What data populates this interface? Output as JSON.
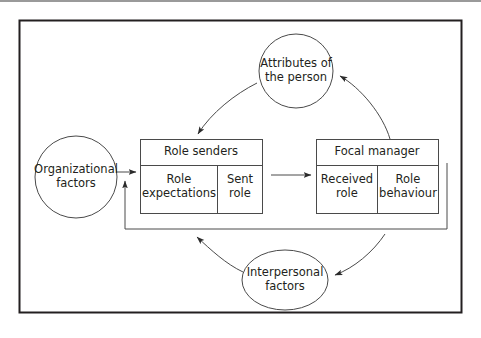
{
  "figure": {
    "type": "cycle-diagram",
    "title_text": "",
    "border_color": "#231f20",
    "line_color": "#3a3a3a",
    "text_color": "#231f20",
    "background": "#ffffff",
    "nodes": [
      {
        "id": "organizational-factors",
        "shape": "circle",
        "label": "Organizational\nfactors",
        "cx": 76,
        "cy": 177,
        "rx": 41,
        "ry": 41
      },
      {
        "id": "attributes-of-the-person",
        "shape": "circle",
        "label": "Attributes of\nthe person",
        "cx": 296,
        "cy": 71,
        "rx": 37,
        "ry": 37
      },
      {
        "id": "interpersonal-factors",
        "shape": "ellipse",
        "label": "Interpersonal\nfactors",
        "cx": 285,
        "cy": 280,
        "rx": 43,
        "ry": 30
      }
    ],
    "boxes": [
      {
        "id": "role-senders",
        "title": "Role senders",
        "x": 140,
        "y": 139,
        "w": 122,
        "h": 74,
        "header_h": 26,
        "cells": [
          {
            "id": "role-expectations",
            "label": "Role\nexpectations",
            "w": 77
          },
          {
            "id": "sent-role",
            "label": "Sent\nrole",
            "w": 45
          }
        ]
      },
      {
        "id": "focal-manager",
        "title": "Focal manager",
        "x": 316,
        "y": 139,
        "w": 122,
        "h": 74,
        "header_h": 26,
        "cells": [
          {
            "id": "received-role",
            "label": "Received\nrole",
            "w": 61
          },
          {
            "id": "role-behaviour",
            "label": "Role\nbehaviour",
            "w": 61
          }
        ]
      }
    ],
    "connectors": [
      {
        "id": "org-to-role-senders",
        "from": "organizational-factors",
        "to": "role-senders",
        "style": "straight",
        "direction": "right"
      },
      {
        "id": "role-senders-to-focal-manager",
        "from": "role-senders",
        "to": "focal-manager",
        "style": "straight",
        "direction": "right"
      },
      {
        "id": "focal-manager-to-attributes",
        "from": "focal-manager",
        "to": "attributes-of-the-person",
        "style": "curved",
        "direction": "up-left"
      },
      {
        "id": "attributes-to-role-senders",
        "from": "attributes-of-the-person",
        "to": "role-senders",
        "style": "curved",
        "direction": "down-left"
      },
      {
        "id": "focal-manager-to-interpersonal",
        "from": "focal-manager",
        "to": "interpersonal-factors",
        "style": "curved",
        "direction": "down-left"
      },
      {
        "id": "interpersonal-to-feedback",
        "from": "interpersonal-factors",
        "to": "feedback-loop",
        "style": "curved",
        "direction": "up-left"
      },
      {
        "id": "feedback-loop",
        "from": "focal-manager",
        "to": "role-senders",
        "style": "orthogonal",
        "direction": "up"
      }
    ]
  }
}
